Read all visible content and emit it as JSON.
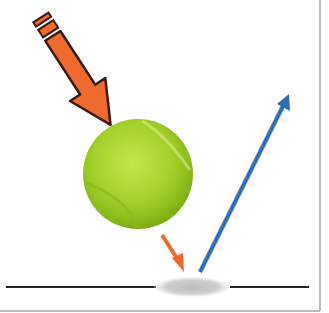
{
  "diagram": {
    "title": "",
    "elements": [
      {
        "name": "incoming-force-arrow",
        "color": "#ee6a2e",
        "outline": "#3a1a10"
      },
      {
        "name": "tennis-ball",
        "color": "#a7d42c"
      },
      {
        "name": "impact-arrow",
        "color": "#ee6a2e"
      },
      {
        "name": "rebound-arrow",
        "color": "#2d6db3"
      },
      {
        "name": "ground-line",
        "color": "#222222"
      },
      {
        "name": "impact-shadow",
        "color": "#c8c8c8"
      }
    ],
    "frame_border_color": "#bdbdbd"
  }
}
